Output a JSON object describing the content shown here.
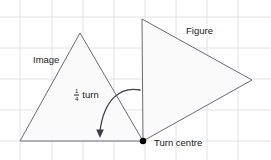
{
  "diagram": {
    "title_text": "Quarter turn rotation of a triangle about a turn centre",
    "width": 271,
    "height": 160,
    "background_color": "#ffffff",
    "grid": {
      "visible": true,
      "color": "#e2e2e6",
      "spacing": 31,
      "x_lines": [
        20,
        52,
        83,
        114,
        145,
        176,
        207,
        238
      ],
      "y_lines": [
        17,
        48,
        79,
        110,
        141
      ]
    },
    "shapes": {
      "stroke_color": "#6b6b72",
      "fill_color": "#fafafa",
      "image_triangle": {
        "name": "Image",
        "points": "20,141 80,33 143,141"
      },
      "figure_triangle": {
        "name": "Figure",
        "points": "142,19 252,80 143,141"
      }
    },
    "turn_centre": {
      "x": 143,
      "y": 141,
      "radius": 3.2,
      "color": "#000000"
    },
    "arrow": {
      "color": "#3d3d45",
      "path": "M140,90 C120,86 104,100 100,131",
      "head_points": "100,138 96.2,129.5 103.8,129.5"
    }
  },
  "labels": {
    "image": "Image",
    "figure": "Figure",
    "turn_centre": "Turn centre",
    "quarter_turn": {
      "numerator": "1",
      "denominator": "4",
      "word": "turn"
    }
  }
}
